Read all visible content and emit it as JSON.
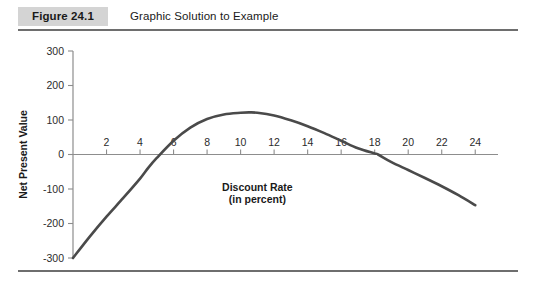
{
  "figure": {
    "badge_label": "Figure 24.1",
    "caption": "Graphic Solution to Example"
  },
  "chart_data": {
    "type": "line",
    "title": "Graphic Solution to Example",
    "xlabel": "Discount Rate",
    "xlabel_sub": "(in percent)",
    "ylabel": "Net Present Value",
    "xlim": [
      0,
      25
    ],
    "ylim": [
      -300,
      300
    ],
    "xticks": [
      2,
      4,
      6,
      8,
      10,
      12,
      14,
      16,
      18,
      20,
      22,
      24
    ],
    "yticks": [
      300,
      200,
      100,
      0,
      -100,
      -200,
      -300
    ],
    "xtick_labels": [
      "2",
      "4",
      "6",
      "8",
      "10",
      "12",
      "14",
      "16",
      "18",
      "20",
      "22",
      "24"
    ],
    "ytick_labels": [
      "300",
      "200",
      "100",
      "0",
      "-100",
      "-200",
      "-300"
    ],
    "grid": false,
    "legend": false,
    "series": [
      {
        "name": "Net Present Value",
        "color": "#4a4a4a",
        "x": [
          0,
          1,
          2,
          3,
          4,
          4.5,
          5,
          6,
          7,
          8,
          9,
          10,
          10.5,
          11,
          12,
          13,
          14,
          15,
          16,
          17,
          18,
          18.2,
          19,
          20,
          21,
          22,
          23,
          24
        ],
        "y": [
          -300,
          -238,
          -180,
          -126,
          -70,
          -38,
          -10,
          40,
          78,
          103,
          116,
          121,
          122,
          121,
          113,
          99,
          82,
          62,
          40,
          18,
          3,
          0,
          -22,
          -45,
          -68,
          -92,
          -118,
          -147
        ]
      }
    ],
    "annotations": [
      {
        "text": "Discount Rate",
        "x": 11,
        "y": -105
      },
      {
        "text": "(in percent)",
        "x": 11,
        "y": -140
      }
    ]
  }
}
